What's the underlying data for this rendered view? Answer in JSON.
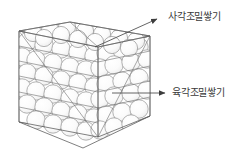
{
  "figure": {
    "title": "",
    "background_color": "#ffffff",
    "line_color": "#6e6e6e",
    "sphere_fill": "#fdfdfd",
    "sphere_stroke": "#8a8a8a",
    "text_color": "#3a3a3a"
  },
  "labels": [
    {
      "id": "ccp",
      "text": "사각조밀쌓기",
      "arrow": "arrowhead-right-icon",
      "arrow_color": "#444444"
    },
    {
      "id": "hcp",
      "text": "육각조밀쌓기",
      "arrow": "arrowhead-right-icon",
      "arrow_color": "#444444"
    }
  ],
  "diagram": {
    "shape": "cube",
    "content": "close-packed-spheres",
    "description_name": "close-packing-cube"
  }
}
